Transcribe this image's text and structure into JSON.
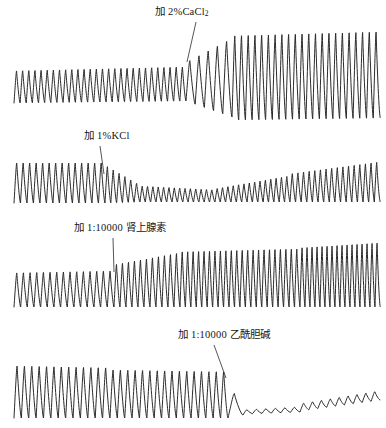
{
  "figure": {
    "title": "",
    "background_color": "#ffffff",
    "trace_color": "#2b2b2b",
    "width": 386,
    "height": 428
  },
  "annotations": [
    {
      "id": "cacl2",
      "prefix": "加 2%CaCl",
      "subscript": "2",
      "suffix": "",
      "full_text": "加 2%CaCl₂",
      "meaning": "Add 2% CaCl2",
      "leader_from": [
        196,
        22
      ],
      "leader_to": [
        187,
        62
      ]
    },
    {
      "id": "kcl",
      "prefix": "加 1%KCl",
      "subscript": "",
      "suffix": "",
      "full_text": "加 1%KCl",
      "meaning": "Add 1% KCl",
      "leader_from": [
        100,
        146
      ],
      "leader_to": [
        104,
        174
      ]
    },
    {
      "id": "adrenaline",
      "prefix": "加 1:10000 肾上腺素",
      "subscript": "",
      "suffix": "",
      "full_text": "加 1:10000 肾上腺素",
      "meaning": "Add 1:10000 adrenaline",
      "leader_from": [
        113,
        238
      ],
      "leader_to": [
        114,
        272
      ]
    },
    {
      "id": "acetylcholine",
      "prefix": "加 1:10000 乙酰胆碱",
      "subscript": "",
      "suffix": "",
      "full_text": "加 1:10000 乙酰胆碱",
      "meaning": "Add 1:10000 acetylcholine",
      "leader_from": [
        214,
        345
      ],
      "leader_to": [
        226,
        378
      ]
    }
  ],
  "chart_data": {
    "type": "line",
    "title": "",
    "subtitle": "",
    "xlabel": "",
    "ylabel": "",
    "grid": false,
    "legend": "none",
    "panels": [
      {
        "id": "panel-cacl2",
        "index": 1,
        "agent_label": "加 2%CaCl₂",
        "baseline_y": 103,
        "x_start": 14,
        "x_end": 380,
        "event_x": 186,
        "effect": "amplitude strongly increased, baseline lifted",
        "segments": [
          {
            "x0": 14,
            "x1": 186,
            "cycles": 28,
            "amp_start": 32,
            "amp_end": 34,
            "base_start": 103,
            "base_end": 101
          },
          {
            "x0": 186,
            "x1": 232,
            "cycles": 5,
            "amp_start": 38,
            "amp_end": 78,
            "base_start": 101,
            "base_end": 117
          },
          {
            "x0": 232,
            "x1": 380,
            "cycles": 22,
            "amp_start": 84,
            "amp_end": 86,
            "base_start": 120,
            "base_end": 118
          }
        ]
      },
      {
        "id": "panel-kcl",
        "index": 2,
        "agent_label": "加 1%KCl",
        "baseline_y": 203,
        "x_start": 14,
        "x_end": 380,
        "event_x": 105,
        "effect": "amplitude strongly decreased then slow recovery",
        "segments": [
          {
            "x0": 14,
            "x1": 105,
            "cycles": 14,
            "amp_start": 40,
            "amp_end": 40,
            "base_start": 203,
            "base_end": 203
          },
          {
            "x0": 105,
            "x1": 140,
            "cycles": 6,
            "amp_start": 38,
            "amp_end": 17,
            "base_start": 203,
            "base_end": 202
          },
          {
            "x0": 140,
            "x1": 215,
            "cycles": 14,
            "amp_start": 16,
            "amp_end": 12,
            "base_start": 202,
            "base_end": 202
          },
          {
            "x0": 215,
            "x1": 290,
            "cycles": 14,
            "amp_start": 13,
            "amp_end": 26,
            "base_start": 202,
            "base_end": 202
          },
          {
            "x0": 290,
            "x1": 380,
            "cycles": 16,
            "amp_start": 28,
            "amp_end": 40,
            "base_start": 202,
            "base_end": 202
          }
        ]
      },
      {
        "id": "panel-adrenaline",
        "index": 3,
        "agent_label": "加 1:10000 肾上腺素",
        "baseline_y": 307,
        "x_start": 14,
        "x_end": 380,
        "event_x": 114,
        "effect": "amplitude and rate increased",
        "segments": [
          {
            "x0": 14,
            "x1": 114,
            "cycles": 15,
            "amp_start": 34,
            "amp_end": 36,
            "base_start": 307,
            "base_end": 307
          },
          {
            "x0": 114,
            "x1": 180,
            "cycles": 11,
            "amp_start": 42,
            "amp_end": 54,
            "base_start": 307,
            "base_end": 307
          },
          {
            "x0": 180,
            "x1": 300,
            "cycles": 22,
            "amp_start": 55,
            "amp_end": 58,
            "base_start": 307,
            "base_end": 307
          },
          {
            "x0": 300,
            "x1": 380,
            "cycles": 16,
            "amp_start": 59,
            "amp_end": 64,
            "base_start": 307,
            "base_end": 307
          }
        ]
      },
      {
        "id": "panel-acetylcholine",
        "index": 4,
        "agent_label": "加 1:10000 乙酰胆碱",
        "baseline_y": 418,
        "x_start": 14,
        "x_end": 380,
        "event_x": 228,
        "effect": "contractions nearly abolished (arrest), slow partial recovery",
        "segments": [
          {
            "x0": 14,
            "x1": 110,
            "cycles": 13,
            "amp_start": 52,
            "amp_end": 50,
            "base_start": 418,
            "base_end": 418
          },
          {
            "x0": 110,
            "x1": 228,
            "cycles": 16,
            "amp_start": 48,
            "amp_end": 46,
            "base_start": 418,
            "base_end": 418
          },
          {
            "x0": 228,
            "x1": 243,
            "cycles": 1,
            "amp_start": 36,
            "amp_end": 10,
            "base_start": 418,
            "base_end": 415
          },
          {
            "x0": 243,
            "x1": 300,
            "cycles": 6,
            "amp_start": 4,
            "amp_end": 5,
            "base_start": 414,
            "base_end": 412
          },
          {
            "x0": 300,
            "x1": 380,
            "cycles": 9,
            "amp_start": 7,
            "amp_end": 9,
            "base_start": 411,
            "base_end": 400
          }
        ]
      }
    ]
  }
}
